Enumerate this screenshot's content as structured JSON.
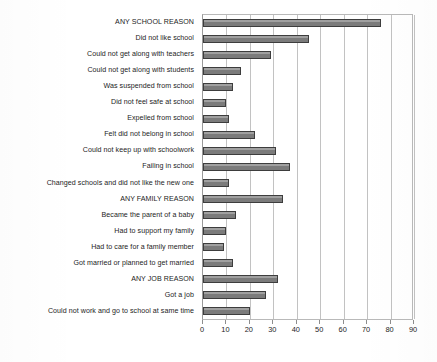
{
  "chart_data": {
    "type": "bar",
    "orientation": "horizontal",
    "title": "",
    "xlabel": "",
    "ylabel": "",
    "xlim": [
      0,
      90
    ],
    "xticks": [
      0,
      10,
      20,
      30,
      40,
      50,
      60,
      70,
      80,
      90
    ],
    "tick_labels": [
      "0",
      "10",
      "20",
      "30",
      "40",
      "50",
      "60",
      "70",
      "80",
      "90"
    ],
    "grid": true,
    "legend": "none",
    "bar_color": "#7b7b7b",
    "bar_edge_color": "#3d3d3d",
    "gridline_color": "#c2c2c2",
    "categories": [
      "ANY SCHOOL REASON",
      "Did not like school",
      "Could not get along with teachers",
      "Could not get along with students",
      "Was suspended from school",
      "Did not feel safe at school",
      "Expelled from school",
      "Felt did not belong in school",
      "Could not keep up with schoolwork",
      "Failing in school",
      "Changed schools and did not like the new one",
      "ANY FAMILY REASON",
      "Became the parent of a baby",
      "Had to support my family",
      "Had to care for a family member",
      "Got married or planned to get married",
      "ANY JOB REASON",
      "Got a job",
      "Could not work and go to school at same time"
    ],
    "values": [
      76,
      45,
      29,
      16,
      13,
      10,
      11,
      22,
      31,
      37,
      11,
      34,
      14,
      10,
      9,
      13,
      32,
      27,
      20
    ]
  }
}
